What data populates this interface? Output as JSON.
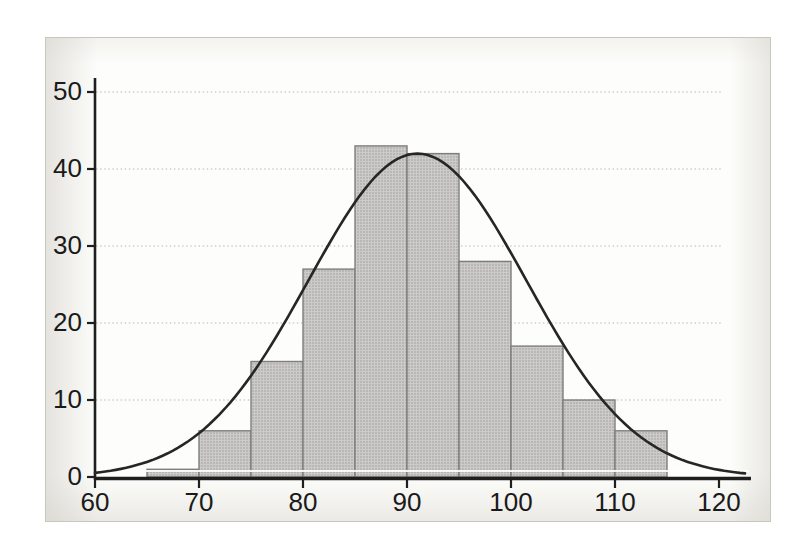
{
  "chart_data": {
    "type": "bar",
    "subtype": "histogram-with-normal-curve",
    "title": "",
    "xlabel": "",
    "ylabel": "",
    "x_tick_labels": [
      "60",
      "70",
      "80",
      "90",
      "100",
      "110",
      "120"
    ],
    "x_tick_values": [
      60,
      70,
      80,
      90,
      100,
      110,
      120
    ],
    "y_tick_labels": [
      "0",
      "10",
      "20",
      "30",
      "40",
      "50"
    ],
    "y_tick_values": [
      0,
      10,
      20,
      30,
      40,
      50
    ],
    "xlim": [
      60,
      122.5
    ],
    "ylim": [
      0,
      52
    ],
    "grid": "horizontal-dotted",
    "legend": "none",
    "bin_width": 5,
    "bin_starts": [
      65,
      70,
      75,
      80,
      85,
      90,
      95,
      100,
      105,
      110
    ],
    "bin_ends": [
      70,
      75,
      80,
      85,
      90,
      95,
      100,
      105,
      110,
      115
    ],
    "frequencies": [
      1,
      6,
      15,
      27,
      43,
      42,
      28,
      17,
      10,
      6
    ],
    "normal_curve": {
      "mean": 91,
      "sd": 10.5,
      "peak": 42
    },
    "colors": {
      "bar_fill": "#cccbc9",
      "bar_dot": "#9a9a98",
      "bar_border": "#7e7e7c",
      "axis": "#1f1f1f",
      "grid": "#b9b8b5",
      "curve": "#262626",
      "label": "#1a1a1a",
      "panel_bg": "#fdfdfb",
      "plot_bg": "#ffffff",
      "panel_border": "#c9c6bf",
      "highlight_line": "#ffffff"
    }
  }
}
